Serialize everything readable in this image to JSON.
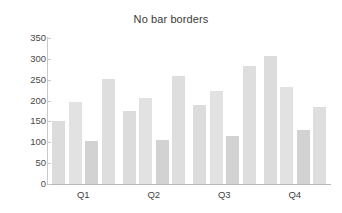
{
  "chart_data": {
    "type": "bar",
    "title": "No bar borders",
    "xlabel": "",
    "ylabel": "",
    "categories": [
      "Q1",
      "Q2",
      "Q3",
      "Q4"
    ],
    "series": [
      {
        "name": "Series 1",
        "values": [
          151,
          176,
          189,
          307
        ],
        "color": "#dcdcdc"
      },
      {
        "name": "Series 2",
        "values": [
          196,
          207,
          222,
          233
        ],
        "color": "#e2e2e2"
      },
      {
        "name": "Series 3",
        "values": [
          102,
          106,
          114,
          129
        ],
        "color": "#d2d2d2"
      },
      {
        "name": "Series 4",
        "values": [
          251,
          259,
          282,
          185
        ],
        "color": "#dedede"
      }
    ],
    "ylim": [
      0,
      350
    ],
    "yticks": [
      0,
      50,
      100,
      150,
      200,
      250,
      300,
      350
    ],
    "ytick_labels": [
      "0",
      "50",
      "100",
      "150",
      "200",
      "250",
      "300",
      "350"
    ],
    "grid": false,
    "legend": "none",
    "bar_borders": false,
    "axis_color": "#c9c9c9",
    "text_color": "#3a3a3a",
    "background": "#ffffff"
  }
}
